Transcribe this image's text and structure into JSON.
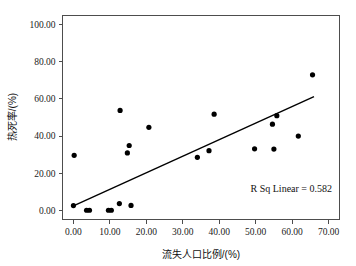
{
  "chart_data": {
    "type": "scatter",
    "title": "",
    "xlabel": "流失人口比例/(%)",
    "ylabel": "热死率/(%)",
    "xlim": [
      -3.0,
      73.0
    ],
    "ylim": [
      -5.0,
      105.0
    ],
    "xticks": [
      0,
      10,
      20,
      30,
      40,
      50,
      60,
      70
    ],
    "xtick_labels": [
      "0.00",
      "10.00",
      "20.00",
      "30.00",
      "40.00",
      "50.00",
      "60.00",
      "70.00"
    ],
    "yticks": [
      0,
      20,
      40,
      60,
      80,
      100
    ],
    "ytick_labels": [
      "0.00",
      "20.00",
      "40.00",
      "60.00",
      "80.00",
      "100.00"
    ],
    "grid": false,
    "legend": false,
    "points": [
      {
        "x": 0.0,
        "y": 2.5
      },
      {
        "x": 0.2,
        "y": 29.6
      },
      {
        "x": 3.6,
        "y": 0.0
      },
      {
        "x": 4.4,
        "y": 0.0
      },
      {
        "x": 9.6,
        "y": 0.0
      },
      {
        "x": 10.4,
        "y": 0.0
      },
      {
        "x": 12.6,
        "y": 3.6
      },
      {
        "x": 12.8,
        "y": 53.8
      },
      {
        "x": 14.8,
        "y": 30.9
      },
      {
        "x": 15.3,
        "y": 34.9
      },
      {
        "x": 15.8,
        "y": 2.6
      },
      {
        "x": 20.7,
        "y": 44.7
      },
      {
        "x": 34.0,
        "y": 28.5
      },
      {
        "x": 37.2,
        "y": 32.1
      },
      {
        "x": 38.6,
        "y": 51.8
      },
      {
        "x": 49.7,
        "y": 33.1
      },
      {
        "x": 54.6,
        "y": 46.4
      },
      {
        "x": 55.0,
        "y": 33.0
      },
      {
        "x": 55.8,
        "y": 51.0
      },
      {
        "x": 61.7,
        "y": 40.0
      },
      {
        "x": 65.6,
        "y": 73.0
      }
    ],
    "fit_line": {
      "label": "R Sq Linear = 0.582",
      "r_squared": 0.582,
      "x_start": 0.0,
      "y_start": 2.3,
      "x_end": 66.0,
      "y_end": 61.2
    },
    "annotation": "R Sq Linear = 0.582",
    "marker_color": "#000000",
    "line_color": "#000000",
    "axis_color": "#4d4d4d",
    "background_color": "#ffffff"
  }
}
